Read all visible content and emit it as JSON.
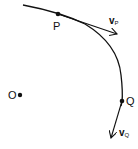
{
  "diagram": {
    "points": {
      "P": {
        "label": "P"
      },
      "Q": {
        "label": "Q"
      },
      "O": {
        "label": "O"
      }
    },
    "vectors": {
      "vP": {
        "main": "v",
        "sub": "P"
      },
      "vQ": {
        "main": "v",
        "sub": "Q"
      }
    },
    "colors": {
      "stroke": "#111111",
      "background": "#ffffff"
    }
  }
}
